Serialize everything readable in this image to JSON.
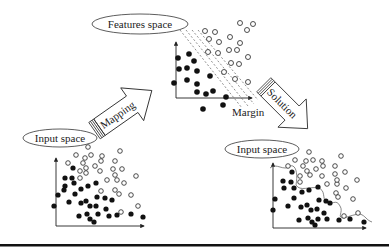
{
  "diagram": {
    "features_space_label": "Features space",
    "input_space_label_left": "Input space",
    "input_space_label_right": "Input space",
    "mapping_label": "Mapping",
    "solution_label": "Solution",
    "margin_label": "Margin"
  }
}
